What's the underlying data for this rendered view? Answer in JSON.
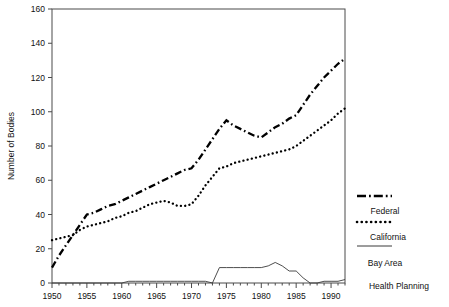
{
  "chart_data": {
    "type": "line",
    "title": "",
    "xlabel": "",
    "ylabel": "Number of Bodies",
    "xlim": [
      1950,
      1992
    ],
    "ylim": [
      0,
      160
    ],
    "ytick_step": 20,
    "xtick_step": 5,
    "grid": false,
    "legend_position": "right",
    "yticks": [
      "0",
      "20",
      "40",
      "60",
      "80",
      "100",
      "120",
      "140",
      "160"
    ],
    "xticks": [
      "1950",
      "1955",
      "1960",
      "1965",
      "1970",
      "1975",
      "1980",
      "1985",
      "1990"
    ],
    "x": [
      1950,
      1951,
      1952,
      1953,
      1954,
      1955,
      1956,
      1957,
      1958,
      1959,
      1960,
      1961,
      1962,
      1963,
      1964,
      1965,
      1966,
      1967,
      1968,
      1969,
      1970,
      1971,
      1972,
      1973,
      1974,
      1975,
      1976,
      1977,
      1978,
      1979,
      1980,
      1981,
      1982,
      1983,
      1984,
      1985,
      1986,
      1987,
      1988,
      1989,
      1990,
      1991,
      1992
    ],
    "series": [
      {
        "name": "Federal",
        "style": "dash-dot",
        "values": [
          9,
          16,
          22,
          28,
          34,
          40,
          41,
          43,
          45,
          46,
          48,
          50,
          52,
          54,
          56,
          58,
          60,
          62,
          64,
          66,
          67,
          72,
          78,
          84,
          90,
          95,
          92,
          90,
          88,
          86,
          85,
          88,
          91,
          93,
          96,
          98,
          104,
          110,
          115,
          120,
          124,
          128,
          131
        ]
      },
      {
        "name": "California",
        "style": "dotted",
        "values": [
          25,
          26,
          27,
          28,
          31,
          33,
          34,
          35,
          36,
          38,
          39,
          41,
          42,
          44,
          46,
          47,
          48,
          47,
          45,
          45,
          46,
          51,
          57,
          62,
          67,
          68,
          70,
          71,
          72,
          73,
          74,
          75,
          76,
          77,
          78,
          80,
          83,
          86,
          89,
          92,
          95,
          99,
          102
        ]
      },
      {
        "name": "Bay Area",
        "style": "solid",
        "values": [
          0,
          0,
          0,
          0,
          0,
          0,
          0,
          0,
          0,
          0,
          0,
          1,
          1,
          1,
          1,
          1,
          1,
          1,
          1,
          1,
          1,
          1,
          1,
          0,
          9,
          9,
          9,
          9,
          9,
          9,
          9,
          10,
          12,
          10,
          7,
          7,
          3,
          0,
          0,
          1,
          1,
          1,
          2
        ]
      }
    ],
    "legend_entries": [
      {
        "label": "Federal",
        "style": "dash-dot"
      },
      {
        "label": "California",
        "style": "dotted"
      },
      {
        "label": "Bay Area",
        "style": "solid"
      },
      {
        "label": "Health Planning",
        "style": "none"
      }
    ]
  }
}
